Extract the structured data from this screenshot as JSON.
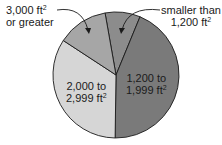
{
  "chart_data": {
    "type": "pie",
    "title": "",
    "start_angle_deg": -10,
    "direction": "clockwise",
    "slices": [
      {
        "label": "smaller than 1,200 ft²",
        "line1": "smaller than",
        "line2": "1,200 ft",
        "value": 9,
        "color": "#8c8c8c"
      },
      {
        "label": "1,200 to 1,999 ft²",
        "line1": "1,200 to",
        "line2": "1,999 ft",
        "value": 44,
        "color": "#7a7a7a"
      },
      {
        "label": "2,000 to 2,999 ft²",
        "line1": "2,000 to",
        "line2": "2,999 ft",
        "value": 34,
        "color": "#d6d6d6"
      },
      {
        "label": "3,000 ft² or greater",
        "line1": "3,000 ft",
        "line2": "or greater",
        "value": 13,
        "color": "#a6a6a6"
      }
    ],
    "unit_superscript": "2"
  }
}
